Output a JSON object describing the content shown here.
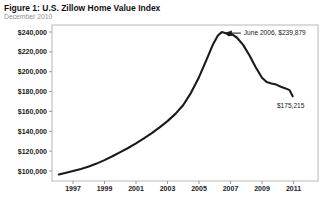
{
  "figure": {
    "title": "Figure 1: U.S. Zillow Home Value Index",
    "subtitle": "December 2010"
  },
  "chart_data": {
    "type": "line",
    "title": "Figure 1: U.S. Zillow Home Value Index",
    "subtitle": "December 2010",
    "xlabel": "",
    "ylabel": "",
    "grid": false,
    "legend": "none",
    "line_color": "#1a1a1a",
    "plot_border_color": "#b8b8b8",
    "xlim": [
      1995.6,
      2011.6
    ],
    "ylim": [
      100000,
      240000
    ],
    "x_ticks": [
      1997,
      1999,
      2001,
      2003,
      2005,
      2007,
      2009,
      2011
    ],
    "y_ticks": [
      100000,
      120000,
      140000,
      160000,
      180000,
      200000,
      220000,
      240000
    ],
    "y_tick_labels": [
      "$100,000",
      "$120,000",
      "$140,000",
      "$160,000",
      "$180,000",
      "$200,000",
      "$220,000",
      "$240,000"
    ],
    "series": [
      {
        "name": "U.S. Zillow Home Value Index",
        "points": [
          [
            1996.1,
            96500
          ],
          [
            1996.5,
            98000
          ],
          [
            1997.0,
            100000
          ],
          [
            1997.5,
            102000
          ],
          [
            1998.0,
            104500
          ],
          [
            1998.5,
            107500
          ],
          [
            1999.0,
            111000
          ],
          [
            1999.5,
            114800
          ],
          [
            2000.0,
            119000
          ],
          [
            2000.5,
            123200
          ],
          [
            2001.0,
            127800
          ],
          [
            2001.5,
            132800
          ],
          [
            2002.0,
            138200
          ],
          [
            2002.5,
            144000
          ],
          [
            2003.0,
            150300
          ],
          [
            2003.5,
            157500
          ],
          [
            2004.0,
            166500
          ],
          [
            2004.5,
            179000
          ],
          [
            2005.0,
            194500
          ],
          [
            2005.5,
            213000
          ],
          [
            2005.9,
            228000
          ],
          [
            2006.2,
            236500
          ],
          [
            2006.45,
            239879
          ],
          [
            2006.7,
            238800
          ],
          [
            2006.9,
            236800
          ],
          [
            2007.1,
            237600
          ],
          [
            2007.4,
            234500
          ],
          [
            2007.8,
            227000
          ],
          [
            2008.2,
            216500
          ],
          [
            2008.6,
            204500
          ],
          [
            2009.0,
            194000
          ],
          [
            2009.3,
            189500
          ],
          [
            2009.6,
            188200
          ],
          [
            2009.9,
            187000
          ],
          [
            2010.2,
            184800
          ],
          [
            2010.5,
            183200
          ],
          [
            2010.75,
            181500
          ],
          [
            2010.95,
            175215
          ]
        ]
      }
    ],
    "annotations": [
      {
        "text": "June 2006, $239,879",
        "target": [
          2006.45,
          239879
        ],
        "arrow": true
      },
      {
        "text": "$175,215",
        "target": [
          2010.95,
          175215
        ],
        "arrow": false
      }
    ]
  }
}
